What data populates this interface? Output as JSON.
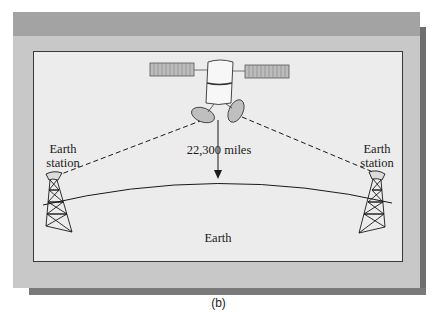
{
  "figure": {
    "caption": "(b)",
    "labels": {
      "left_station_line1": "Earth",
      "left_station_line2": "station",
      "right_station_line1": "Earth",
      "right_station_line2": "station",
      "altitude": "22,300 miles",
      "earth": "Earth"
    },
    "colors": {
      "panel": "#c8c8c8",
      "band": "#a3a3a3",
      "inner": "#ececec",
      "shadow": "#6e6e6e",
      "line": "#1a1a1a"
    }
  }
}
